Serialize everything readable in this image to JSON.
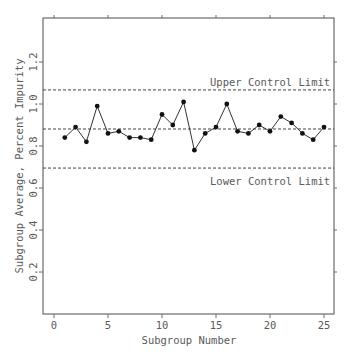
{
  "chart_data": {
    "type": "line",
    "title": "",
    "xlabel": "Subgroup Number",
    "ylabel": "Subgroup Average, Percent Impurity",
    "xlim": [
      -1,
      26
    ],
    "ylim": [
      0,
      1.4
    ],
    "x_ticks": [
      0,
      5,
      10,
      15,
      20,
      25
    ],
    "y_ticks": [
      0.2,
      0.4,
      0.6,
      0.8,
      1.0,
      1.2
    ],
    "y_tick_labels": [
      "0.2",
      "0.4",
      "0.6",
      "0.8",
      "1.0",
      "1.2"
    ],
    "grid": false,
    "legend": "none",
    "x": [
      1,
      2,
      3,
      4,
      5,
      6,
      7,
      8,
      9,
      10,
      11,
      12,
      13,
      14,
      15,
      16,
      17,
      18,
      19,
      20,
      21,
      22,
      23,
      24,
      25
    ],
    "series": [
      {
        "name": "Subgroup Average",
        "values": [
          0.84,
          0.89,
          0.82,
          0.99,
          0.86,
          0.87,
          0.84,
          0.84,
          0.83,
          0.95,
          0.9,
          1.01,
          0.78,
          0.86,
          0.89,
          1.0,
          0.87,
          0.86,
          0.9,
          0.87,
          0.94,
          0.91,
          0.86,
          0.83,
          0.89
        ]
      }
    ],
    "reference_lines": [
      {
        "name": "Upper Control Limit",
        "value": 1.067,
        "style": "dashed",
        "label": "Upper Control Limit"
      },
      {
        "name": "Center Line",
        "value": 0.881,
        "style": "dashed",
        "label": ""
      },
      {
        "name": "Lower Control Limit",
        "value": 0.695,
        "style": "dashed",
        "label": "Lower Control Limit"
      }
    ]
  },
  "labels": {
    "xlabel": "Subgroup Number",
    "ylabel": "Subgroup Average, Percent Impurity",
    "ucl": "Upper Control Limit",
    "lcl": "Lower Control Limit"
  },
  "colors": {
    "axis": "#6a6a6a",
    "line": "#333333",
    "marker": "#111111",
    "text": "#5a5a5a"
  }
}
